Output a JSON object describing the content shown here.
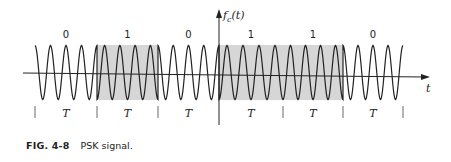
{
  "figure": {
    "y_axis_label": "f_c(t)",
    "y_axis_label_main": "f",
    "y_axis_label_sub": "c",
    "y_axis_label_arg": "(t)",
    "x_axis_label": "t",
    "period_label": "T",
    "bits": [
      "0",
      "1",
      "0",
      "1",
      "1",
      "0"
    ],
    "shaded_bits": [
      1,
      3,
      4
    ],
    "shade_color": "#d6d6d6",
    "line_color": "#222222"
  },
  "caption": {
    "number": "FIG. 4-8",
    "text": "PSK signal."
  }
}
